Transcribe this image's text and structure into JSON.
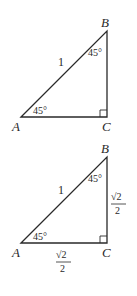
{
  "diagrams": [
    {
      "vertices": {
        "A": "A",
        "B": "B",
        "C": "C"
      },
      "angle_A": "45°",
      "angle_B": "45°",
      "hypotenuse": "1"
    },
    {
      "vertices": {
        "A": "A",
        "B": "B",
        "C": "C"
      },
      "angle_A": "45°",
      "angle_B": "45°",
      "hypotenuse": "1",
      "leg_BC": {
        "num": "√2",
        "den": "2"
      },
      "leg_AC": {
        "num": "√2",
        "den": "2"
      }
    }
  ],
  "colors": {
    "line": "#2a2a2a",
    "background": "#ffffff"
  }
}
